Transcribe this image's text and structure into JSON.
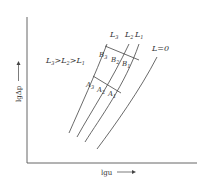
{
  "diagram": {
    "type": "packed-column pressure drop vs gas velocity (log-log)",
    "axes": {
      "x_label": "lgu",
      "y_label": "lgΔp",
      "x_arrow": "→",
      "y_arrow": "→"
    },
    "relation_text": {
      "parts": [
        "L",
        "3",
        ">L",
        "2",
        ">L",
        "1"
      ]
    },
    "curves": [
      {
        "id": "L3",
        "label": "L",
        "sub": "3"
      },
      {
        "id": "L2",
        "label": "L",
        "sub": "2"
      },
      {
        "id": "L1",
        "label": "L",
        "sub": "1"
      },
      {
        "id": "L0",
        "label": "L=0"
      }
    ],
    "flooding_points": [
      {
        "label": "B",
        "sub": "3"
      },
      {
        "label": "B",
        "sub": "2"
      },
      {
        "label": "B",
        "sub": "1"
      }
    ],
    "loading_points": [
      {
        "label": "A",
        "sub": "3"
      },
      {
        "label": "A",
        "sub": "2"
      },
      {
        "label": "A",
        "sub": "1"
      }
    ],
    "colors": {
      "line": "#444444",
      "text": "#333333",
      "background": "#ffffff"
    }
  }
}
